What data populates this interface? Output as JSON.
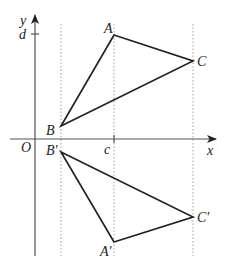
{
  "diagram": {
    "type": "coordinate-geometry-reflection",
    "axes": {
      "x_label": "x",
      "y_label": "y",
      "origin_label": "O",
      "x_tick_label": "c",
      "y_tick_label": "d"
    },
    "triangle_original": {
      "vertices": [
        "A",
        "B",
        "C"
      ],
      "labels": {
        "A": "A",
        "B": "B",
        "C": "C"
      }
    },
    "triangle_reflected": {
      "vertices": [
        "A′",
        "B′",
        "C′"
      ],
      "labels": {
        "A": "A′",
        "B": "B′",
        "C": "C′"
      }
    },
    "guide_lines": [
      "vertical dotted line through B and B′",
      "vertical dotted line at x = c through A and A′",
      "vertical dotted line through C and C′"
    ],
    "colors": {
      "lines": "#222222",
      "axes": "#555555",
      "guides": "#999999",
      "background": "#ffffff"
    }
  }
}
